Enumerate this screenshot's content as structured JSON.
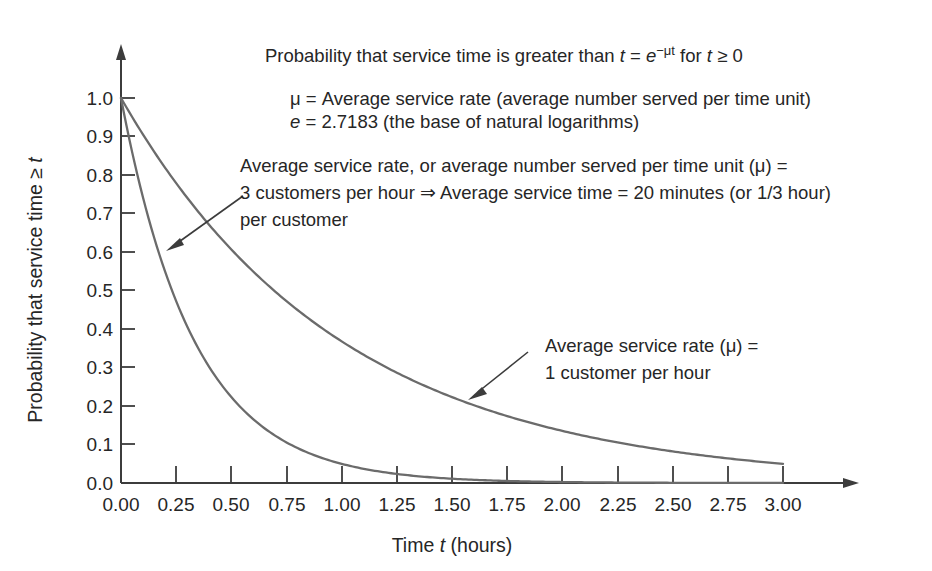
{
  "figure": {
    "background_color": "#ffffff",
    "axis_color": "#3c3c3c",
    "curve_color": "#6b6b6b"
  },
  "title_line": {
    "part1": "Probability that service time is greater than ",
    "var_t": "t",
    "eq": " = ",
    "base_e": "e",
    "exponent": "−μt",
    "part2": " for ",
    "var_t2": "t",
    "part3": " ≥ 0"
  },
  "definitions": [
    {
      "symbol": "μ",
      "text": " = Average service rate (average number served per time unit)"
    },
    {
      "symbol": "e",
      "text": " = 2.7183 (the base of natural logarithms)"
    }
  ],
  "annotations": [
    {
      "id": "mu-3-annotation",
      "lines": [
        "Average service rate, or average number served per time unit (μ) =",
        "3 customers per hour ⇒ Average service time = 20 minutes (or 1/3 hour)",
        "per customer"
      ]
    },
    {
      "id": "mu-1-annotation",
      "lines": [
        "Average service rate (μ) =",
        "1 customer per hour"
      ]
    }
  ],
  "chart_data": {
    "type": "line",
    "xlabel": "Time t (hours)",
    "ylabel": "Probability that service time ≥ t",
    "xlim": [
      0.0,
      3.0
    ],
    "ylim": [
      0.0,
      1.0
    ],
    "grid": false,
    "legend": "none (curves labeled with leader-line annotations)",
    "xticks": [
      "0.00",
      "0.25",
      "0.50",
      "0.75",
      "1.00",
      "1.25",
      "1.50",
      "1.75",
      "2.00",
      "2.25",
      "2.50",
      "2.75",
      "3.00"
    ],
    "yticks": [
      "0.0",
      "0.1",
      "0.2",
      "0.3",
      "0.4",
      "0.5",
      "0.6",
      "0.7",
      "0.8",
      "0.9",
      "1.0"
    ],
    "x": [
      0.0,
      0.25,
      0.5,
      0.75,
      1.0,
      1.25,
      1.5,
      1.75,
      2.0,
      2.25,
      2.5,
      2.75,
      3.0
    ],
    "series": [
      {
        "name": "Average service rate (μ) = 1 customer per hour",
        "formula": "e^(-1t)",
        "mu": 1,
        "values": [
          1.0,
          0.7788,
          0.6065,
          0.4724,
          0.3679,
          0.2865,
          0.2231,
          0.1738,
          0.1353,
          0.1054,
          0.0821,
          0.0639,
          0.0498
        ]
      },
      {
        "name": "Average service rate (μ) = 3 customers per hour",
        "formula": "e^(-3t)",
        "mu": 3,
        "values": [
          1.0,
          0.4724,
          0.2231,
          0.1054,
          0.0498,
          0.0235,
          0.0111,
          0.0052,
          0.0025,
          0.0012,
          0.0006,
          0.0003,
          0.0001
        ]
      }
    ]
  }
}
